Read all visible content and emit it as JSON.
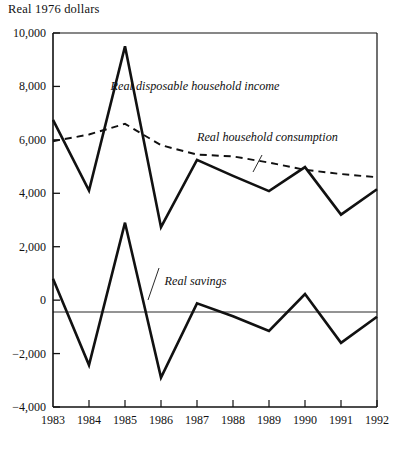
{
  "chart_data": {
    "type": "line",
    "title": "Real 1976 dollars",
    "xlabel": "",
    "ylabel": "Real 1976 dollars",
    "grid": false,
    "legend_position": "inline-annotations",
    "x": [
      1983,
      1984,
      1985,
      1986,
      1987,
      1988,
      1989,
      1990,
      1991,
      1992
    ],
    "categories": [
      "1983",
      "1984",
      "1985",
      "1986",
      "1987",
      "1988",
      "1989",
      "1990",
      "1991",
      "1992"
    ],
    "xlim": [
      1983,
      1992
    ],
    "ylim": [
      -4000,
      10000
    ],
    "ytick_labels": [
      "10,000",
      "8,000",
      "6,000",
      "4,000",
      "2,000",
      "0",
      "−2,000",
      "−4,000"
    ],
    "ytick_values": [
      10000,
      8000,
      6000,
      4000,
      2000,
      0,
      -2000,
      -4000
    ],
    "series": [
      {
        "name": "Real disposable household income",
        "style": "solid",
        "values": [
          6750,
          4100,
          9500,
          2730,
          5250,
          4650,
          4080,
          4980,
          3200,
          4150
        ]
      },
      {
        "name": "Real household consumption",
        "style": "dashed",
        "values": [
          5950,
          6200,
          6600,
          5800,
          5450,
          5380,
          5150,
          4880,
          4720,
          4600
        ]
      },
      {
        "name": "Real savings",
        "style": "solid",
        "values": [
          800,
          -2430,
          2900,
          -2900,
          -120,
          -600,
          -1150,
          230,
          -1600,
          -620
        ]
      }
    ],
    "annotations": [
      {
        "text": "Real disposable household income",
        "x": 1984.6,
        "y": 7850
      },
      {
        "text": "Real household consumption",
        "x": 1987.0,
        "y": 5960
      },
      {
        "text": "Real savings",
        "x": 1986.1,
        "y": 560
      }
    ]
  }
}
